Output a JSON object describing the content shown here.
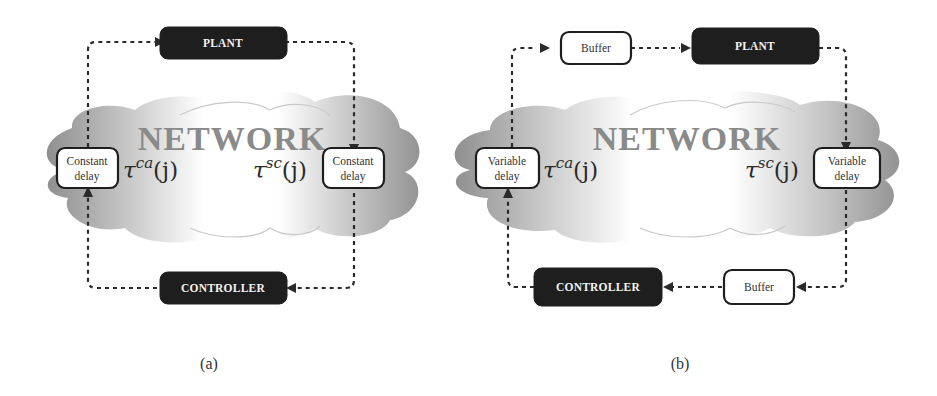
{
  "diagrams": [
    {
      "id": "a",
      "caption": "(a)",
      "network_label": "NETWORK",
      "plant_label": "PLANT",
      "controller_label": "CONTROLLER",
      "left_delay": {
        "line1": "Constant",
        "line2": "delay"
      },
      "right_delay": {
        "line1": "Constant",
        "line2": "delay"
      },
      "tau_left": {
        "base": "τ",
        "sup": "ca",
        "arg": "(j)"
      },
      "tau_right": {
        "base": "τ",
        "sup": "sc",
        "arg": "(j)"
      }
    },
    {
      "id": "b",
      "caption": "(b)",
      "network_label": "NETWORK",
      "plant_label": "PLANT",
      "controller_label": "CONTROLLER",
      "top_buffer_label": "Buffer",
      "bottom_buffer_label": "Buffer",
      "left_delay": {
        "line1": "Variable",
        "line2": "delay"
      },
      "right_delay": {
        "line1": "Variable",
        "line2": "delay"
      },
      "tau_left": {
        "base": "τ",
        "sup": "ca",
        "arg": "(j)"
      },
      "tau_right": {
        "base": "τ",
        "sup": "sc",
        "arg": "(j)"
      }
    }
  ],
  "colors": {
    "block_dark": "#1e1e1e",
    "network_text": "#8a8a8a",
    "cloud_dark": "#9a9a9a",
    "cloud_light": "#ffffff"
  }
}
